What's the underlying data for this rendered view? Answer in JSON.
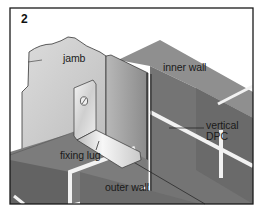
{
  "figure": {
    "number": "2",
    "labels": {
      "jamb": "jamb",
      "inner_wall": "inner wall",
      "vertical_dpc_line1": "vertical",
      "vertical_dpc_line2": "DPC",
      "fixing_lug": "fixing lug",
      "outer_wall": "outer wall"
    },
    "icons": {
      "screw": "screw-head-icon"
    },
    "colors": {
      "frame": "#1a1a1a",
      "jamb_face": "#d2d2d2",
      "inner_wall_top": "#8e8e8e",
      "inner_wall_face": "#6f6f6f",
      "dpc": "#9d9d9d",
      "lug": "#e4e4e4",
      "outer_wall_top": "#7d7d7d",
      "outer_wall_face": "#5f5f5f",
      "mortar": "#f2f2f2"
    }
  }
}
